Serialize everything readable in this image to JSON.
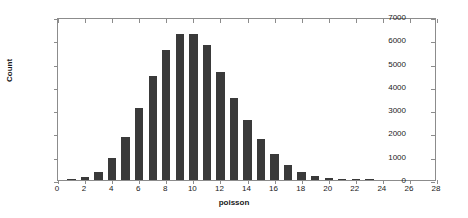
{
  "chart_data": {
    "type": "bar",
    "title": "",
    "subtitle": "",
    "xlabel": "poisson",
    "ylabel": "Count",
    "xlim": [
      0,
      28
    ],
    "ylim": [
      0,
      7000
    ],
    "grid": false,
    "legend": null,
    "bar_color": "#3a3a3a",
    "axis_color": "#8c8c8c",
    "xticks": [
      0,
      2,
      4,
      6,
      8,
      10,
      12,
      14,
      16,
      18,
      20,
      22,
      24,
      26,
      28
    ],
    "yticks": [
      0,
      1000,
      2000,
      3000,
      4000,
      5000,
      6000,
      7000
    ],
    "xtick_labels": [
      "0",
      "2",
      "4",
      "6",
      "8",
      "10",
      "12",
      "14",
      "16",
      "18",
      "20",
      "22",
      "24",
      "26",
      "28"
    ],
    "ytick_labels": [
      "0",
      "1000",
      "2000",
      "3000",
      "4000",
      "5000",
      "6000",
      "7000"
    ],
    "bar_width": 0.62,
    "categories": [
      1,
      2,
      3,
      4,
      5,
      6,
      7,
      8,
      9,
      10,
      11,
      12,
      13,
      14,
      15,
      16,
      17,
      18,
      19,
      20,
      21,
      22,
      23
    ],
    "values": [
      20,
      110,
      360,
      930,
      1850,
      3100,
      4450,
      5590,
      6250,
      6270,
      5800,
      4650,
      3520,
      2590,
      1750,
      1130,
      640,
      330,
      180,
      70,
      40,
      15,
      5
    ]
  }
}
